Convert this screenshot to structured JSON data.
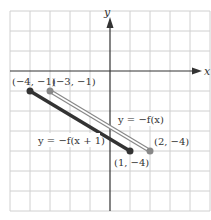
{
  "graph": {
    "axes": {
      "x_label": "x",
      "y_label": "y"
    },
    "grid": {
      "x_min": -5,
      "x_max": 5,
      "y_min": -7,
      "y_max": 3,
      "step": 1
    },
    "colors": {
      "grid": "#d0d0d0",
      "axis": "#333333",
      "shifted_line": "#333333",
      "original_line": "#888888"
    },
    "segments": [
      {
        "name": "y = -f(x+1)",
        "label": "y = −f(x + 1)",
        "start": {
          "x": -4,
          "y": -1,
          "label": "(−4, −1)"
        },
        "end": {
          "x": 1,
          "y": -4,
          "label": "(1, −4)"
        },
        "color": "#333333"
      },
      {
        "name": "y = -f(x)",
        "label": "y = −f(x)",
        "start": {
          "x": -3,
          "y": -1,
          "label": "(−3, −1)"
        },
        "end": {
          "x": 2,
          "y": -4,
          "label": "(2, −4)"
        },
        "color": "#888888"
      }
    ]
  }
}
